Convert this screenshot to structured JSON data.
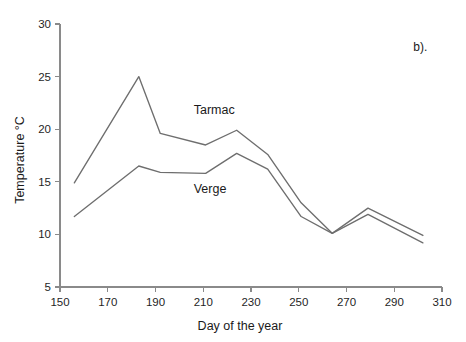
{
  "panel": {
    "label": "b)."
  },
  "chart_data": {
    "type": "line",
    "title": "",
    "subtitle": "",
    "xlabel": "Day of the year",
    "ylabel": "Temperature °C",
    "xlim": [
      150,
      310
    ],
    "ylim": [
      5,
      30
    ],
    "xticks": [
      150,
      170,
      190,
      210,
      230,
      250,
      270,
      290,
      310
    ],
    "yticks": [
      5,
      10,
      15,
      20,
      25,
      30
    ],
    "xtick_labels": [
      "150",
      "170",
      "190",
      "210",
      "230",
      "250",
      "270",
      "290",
      "310"
    ],
    "ytick_labels": [
      "5",
      "10",
      "15",
      "20",
      "25",
      "30"
    ],
    "grid": false,
    "legend": "inline-annotations",
    "legend_position": "inside-plot",
    "annotations": [
      {
        "text": "Tarmac",
        "x": 206,
        "y": 21.4
      },
      {
        "text": "Verge",
        "x": 206,
        "y": 13.9
      },
      {
        "text": "b).",
        "x": 298,
        "y": 27.4
      }
    ],
    "series": [
      {
        "name": "Tarmac",
        "color": "#6e6e6e",
        "x": [
          156,
          183,
          192,
          211,
          224,
          237,
          251,
          264,
          279,
          302
        ],
        "y": [
          14.9,
          25.0,
          19.6,
          18.5,
          19.9,
          17.6,
          13.0,
          10.1,
          12.5,
          9.9
        ]
      },
      {
        "name": "Verge",
        "color": "#6e6e6e",
        "x": [
          156,
          183,
          192,
          211,
          224,
          237,
          251,
          264,
          279,
          302
        ],
        "y": [
          11.7,
          16.5,
          15.9,
          15.8,
          17.7,
          16.2,
          11.7,
          10.1,
          11.9,
          9.2
        ]
      }
    ]
  }
}
